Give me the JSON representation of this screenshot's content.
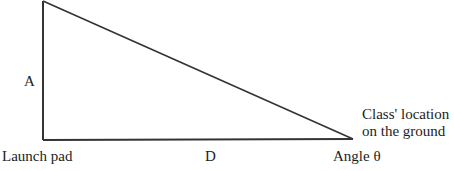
{
  "diagram": {
    "type": "right-triangle",
    "vertices": {
      "top": {
        "x": 43,
        "y": 1
      },
      "launch_pad": {
        "x": 43,
        "y": 140
      },
      "class_location": {
        "x": 353,
        "y": 139
      }
    },
    "stroke_color": "#333333",
    "labels": {
      "vertical_side": "A",
      "horizontal_side": "D",
      "bottom_left_vertex": "Launch pad",
      "angle_vertex": "Angle θ",
      "right_vertex_line1": "Class' location",
      "right_vertex_line2": "on the ground"
    }
  }
}
